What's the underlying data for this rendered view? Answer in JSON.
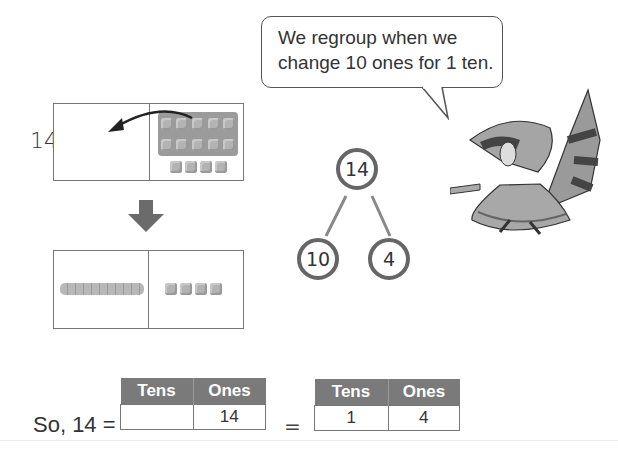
{
  "speech_bubble": {
    "line1": "We regroup when we",
    "line2": "change 10 ones for 1 ten."
  },
  "top_model": {
    "number_label": "14",
    "left_cell": "",
    "right_cell": {
      "ten_frame_cubes": 10,
      "loose_cubes": 4
    },
    "arrow": "curved-arrow-left"
  },
  "down_arrow": "down-arrow",
  "bottom_model": {
    "left_cell": {
      "ten_rods": 1
    },
    "right_cell": {
      "loose_cubes": 4
    }
  },
  "number_bond": {
    "whole": "14",
    "parts": [
      "10",
      "4"
    ]
  },
  "equation": {
    "prefix": "So, 14 =",
    "equals": "=",
    "table1": {
      "headers": [
        "Tens",
        "Ones"
      ],
      "values": [
        "",
        "14"
      ]
    },
    "table2": {
      "headers": [
        "Tens",
        "Ones"
      ],
      "values": [
        "1",
        "4"
      ]
    }
  },
  "illustration": "raccoon-character",
  "colors": {
    "header_bg": "#7a7a7a",
    "border": "#777777",
    "circle_border": "#666666"
  }
}
